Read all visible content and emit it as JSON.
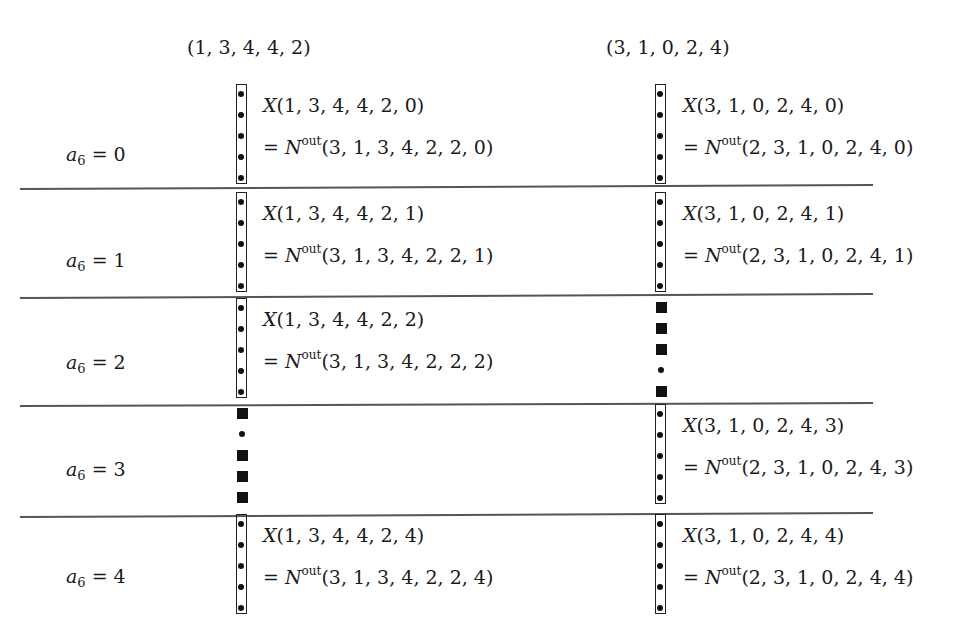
{
  "columns": [
    {
      "header": "(1, 3, 4, 4, 2)"
    },
    {
      "header": "(3, 1, 0, 2, 4)"
    }
  ],
  "rows": [
    {
      "label_var": "a",
      "label_sub": "6",
      "label_eq": " = 0",
      "left": {
        "kind": "box",
        "x_text": "(1, 3, 4, 4, 2, 0)",
        "n_text": "(3, 1, 3, 4, 2, 2, 0)"
      },
      "right": {
        "kind": "box",
        "x_text": "(3, 1, 0, 2, 4, 0)",
        "n_text": "(2, 3, 1, 0, 2, 4, 0)"
      }
    },
    {
      "label_var": "a",
      "label_sub": "6",
      "label_eq": " = 1",
      "left": {
        "kind": "box",
        "x_text": "(1, 3, 4, 4, 2, 1)",
        "n_text": "(3, 1, 3, 4, 2, 2, 1)"
      },
      "right": {
        "kind": "box",
        "x_text": "(3, 1, 0, 2, 4, 1)",
        "n_text": "(2, 3, 1, 0, 2, 4, 1)"
      }
    },
    {
      "label_var": "a",
      "label_sub": "6",
      "label_eq": " = 2",
      "left": {
        "kind": "box",
        "x_text": "(1, 3, 4, 4, 2, 2)",
        "n_text": "(3, 1, 3, 4, 2, 2, 2)"
      },
      "right": {
        "kind": "pattern",
        "pattern": [
          "square",
          "square",
          "square",
          "dot",
          "square"
        ]
      }
    },
    {
      "label_var": "a",
      "label_sub": "6",
      "label_eq": " = 3",
      "left": {
        "kind": "pattern",
        "pattern": [
          "square",
          "dot",
          "square",
          "square",
          "square"
        ]
      },
      "right": {
        "kind": "box",
        "x_text": "(3, 1, 0, 2, 4, 3)",
        "n_text": "(2, 3, 1, 0, 2, 4, 3)"
      }
    },
    {
      "label_var": "a",
      "label_sub": "6",
      "label_eq": " = 4",
      "left": {
        "kind": "box",
        "x_text": "(1, 3, 4, 4, 2, 4)",
        "n_text": "(3, 1, 3, 4, 2, 2, 4)"
      },
      "right": {
        "kind": "box",
        "x_text": "(3, 1, 0, 2, 4, 4)",
        "n_text": "(2, 3, 1, 0, 2, 4, 4)"
      }
    }
  ],
  "symbols": {
    "x": "X",
    "eq_prefix": "= ",
    "n": "N",
    "n_sup": "out"
  }
}
